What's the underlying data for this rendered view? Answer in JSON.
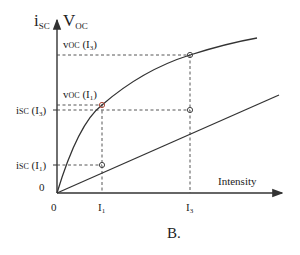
{
  "diagram": {
    "caption": "B.",
    "y_axis_label": {
      "main": "i",
      "main_sub": "SC",
      "second": "V",
      "second_sub": "OC"
    },
    "x_axis_label": "Intensity",
    "origin_x_label": "0",
    "origin_y_label": "0",
    "x_ticks": [
      {
        "label": "I",
        "sub": "1"
      },
      {
        "label": "I",
        "sub": "3"
      }
    ],
    "y_labels": [
      {
        "text": "i",
        "sub": "SC",
        "arg": " (I",
        "arg_sub": "3",
        "close": ")"
      },
      {
        "text": "i",
        "sub": "SC",
        "arg": " (I",
        "arg_sub": "1",
        "close": ")"
      }
    ],
    "annotations": [
      {
        "text": "v",
        "sub": "OC",
        "arg": " (I",
        "arg_sub": "3",
        "close": ")"
      },
      {
        "text": "v",
        "sub": "OC",
        "arg": " (I",
        "arg_sub": "1",
        "close": ")"
      }
    ],
    "curves": [
      {
        "name": "v_oc",
        "shape": "logarithmic (concave, saturating)"
      },
      {
        "name": "i_sc",
        "shape": "linear"
      }
    ],
    "colors": {
      "line": "#333333",
      "marker_voc_i1": "#c0392b",
      "marker": "#555555"
    }
  }
}
